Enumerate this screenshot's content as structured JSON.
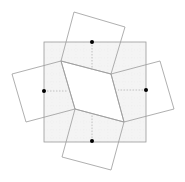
{
  "diagram": {
    "colors": {
      "background": "#ffffff",
      "line": "#9a9a9a",
      "dashed": "#b5b5b5",
      "shade": "#f4f4f4",
      "dot": "#000000"
    },
    "outer_square": {
      "x": 44,
      "y": 42,
      "width": 102,
      "height": 100
    },
    "center_quad": [
      [
        61,
        61
      ],
      [
        111,
        74
      ],
      [
        124,
        122
      ],
      [
        75,
        109
      ]
    ],
    "squares": [
      {
        "name": "top",
        "points": [
          [
            74,
            12
          ],
          [
            125,
            27
          ],
          [
            111,
            74
          ],
          [
            61,
            61
          ]
        ],
        "dot": [
          92,
          42
        ],
        "guide": [
          [
            92,
            42
          ],
          [
            92,
            70
          ]
        ]
      },
      {
        "name": "left",
        "points": [
          [
            12,
            74
          ],
          [
            61,
            61
          ],
          [
            75,
            109
          ],
          [
            26,
            122
          ]
        ],
        "dot": [
          44,
          91
        ],
        "guide": [
          [
            44,
            91
          ],
          [
            68,
            91
          ]
        ]
      },
      {
        "name": "right",
        "points": [
          [
            111,
            74
          ],
          [
            160,
            61
          ],
          [
            174,
            109
          ],
          [
            124,
            122
          ]
        ],
        "dot": [
          146,
          90
        ],
        "guide": [
          [
            146,
            90
          ],
          [
            118,
            90
          ]
        ]
      },
      {
        "name": "bottom",
        "points": [
          [
            75,
            109
          ],
          [
            124,
            122
          ],
          [
            111,
            170
          ],
          [
            62,
            157
          ]
        ],
        "dot": [
          92,
          141
        ],
        "guide": [
          [
            92,
            141
          ],
          [
            92,
            115
          ]
        ]
      }
    ]
  }
}
